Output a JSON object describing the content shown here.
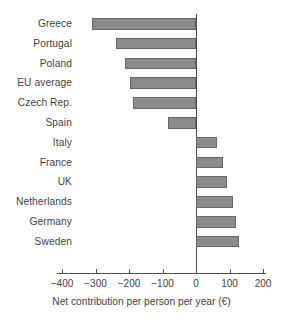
{
  "chart_data": {
    "type": "bar",
    "orientation": "horizontal",
    "title": "",
    "xlabel": "Net contribution per person per year (€)",
    "ylabel": "",
    "xlim": [
      -400,
      200
    ],
    "xticks": [
      -400,
      -300,
      -200,
      -100,
      0,
      100,
      200
    ],
    "xticklabels": [
      "−400",
      "−300",
      "−200",
      "−100",
      "0",
      "100",
      "200"
    ],
    "grid": false,
    "legend": false,
    "zero_reference_line": true,
    "categories": [
      "Greece",
      "Portugal",
      "Poland",
      "EU average",
      "Czech Rep.",
      "Spain",
      "Italy",
      "France",
      "UK",
      "Netherlands",
      "Germany",
      "Sweden"
    ],
    "values": [
      -310,
      -240,
      -212,
      -197,
      -188,
      -84,
      63,
      80,
      92,
      110,
      120,
      128
    ],
    "series": [
      {
        "name": "Net contribution per person per year (€)",
        "values": [
          -310,
          -240,
          -212,
          -197,
          -188,
          -84,
          63,
          80,
          92,
          110,
          120,
          128
        ]
      }
    ],
    "colors": {
      "bar_fill": "#8b8b8b",
      "bar_border": "#666666",
      "axis": "#4d4d4d",
      "text": "#3f3f3f",
      "background": "#ffffff"
    }
  }
}
